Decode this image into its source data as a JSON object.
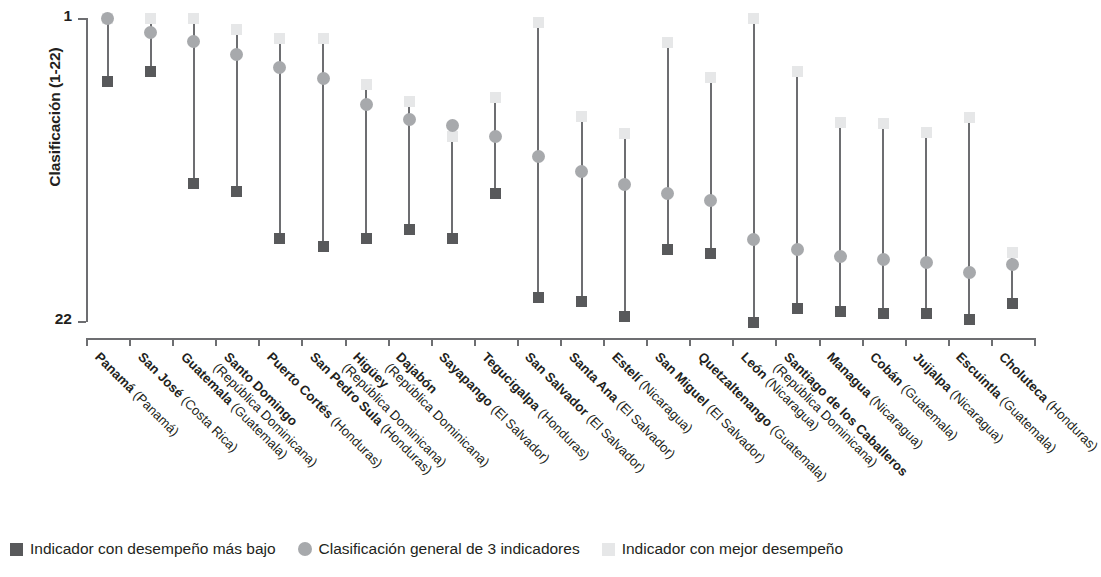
{
  "chart_data": {
    "type": "scatter",
    "title": "",
    "subtitle": "",
    "xlabel": "",
    "ylabel": "Clasificación (1-22)",
    "ylim": [
      1,
      22
    ],
    "y_ticks": [
      "1",
      "22"
    ],
    "y_axis_inverted": true,
    "grid": false,
    "legend_position": "bottom",
    "colors": {
      "lowest": "#58595b",
      "overall": "#a7a9ac",
      "best": "#e6e7e8",
      "axis": "#6d6e71",
      "text": "#231f20"
    },
    "legend": [
      {
        "marker": "square",
        "color": "#58595b",
        "label": "Indicador con desempeño más bajo"
      },
      {
        "marker": "circle",
        "color": "#a7a9ac",
        "label": "Clasificación general de 3 indicadores"
      },
      {
        "marker": "square",
        "color": "#e6e7e8",
        "label": "Indicador con mejor desempeño"
      }
    ],
    "series": [
      {
        "name": "Indicador con desempeño más bajo",
        "marker": "square",
        "color": "#58595b",
        "values": [
          5.4,
          4.7,
          12.4,
          13.0,
          16.2,
          16.8,
          16.2,
          15.6,
          16.2,
          13.1,
          20.3,
          20.6,
          21.6,
          17.0,
          17.3,
          22.0,
          21.1,
          21.3,
          21.4,
          21.4,
          21.8,
          20.7
        ]
      },
      {
        "name": "Clasificación general de 3 indicadores",
        "marker": "circle",
        "color": "#a7a9ac",
        "values": [
          1.0,
          2.0,
          2.6,
          3.5,
          4.4,
          5.2,
          7.0,
          8.0,
          8.4,
          9.2,
          10.6,
          11.6,
          12.5,
          13.1,
          13.6,
          16.3,
          17.0,
          17.5,
          17.7,
          17.9,
          18.6,
          18.0
        ]
      },
      {
        "name": "Indicador con mejor desempeño",
        "marker": "square",
        "color": "#e6e7e8",
        "values": [
          1.0,
          1.0,
          1.0,
          1.8,
          2.4,
          2.4,
          5.6,
          6.8,
          9.2,
          6.5,
          1.3,
          7.8,
          9.0,
          2.7,
          5.1,
          1.0,
          4.7,
          8.2,
          8.3,
          8.9,
          7.9,
          17.2
        ]
      }
    ],
    "categories": [
      {
        "city": "Panamá",
        "country": "(Panamá)"
      },
      {
        "city": "San José",
        "country": "(Costa Rica)"
      },
      {
        "city": "Guatemala",
        "country": "(Guatemala)"
      },
      {
        "city": "Santo Domingo",
        "country": "(República Dominicana)"
      },
      {
        "city": "Puerto Cortés",
        "country": "(Honduras)"
      },
      {
        "city": "San Pedro Sula",
        "country": "(Honduras)"
      },
      {
        "city": "Higüey",
        "country": "(República Dominicana)"
      },
      {
        "city": "Dajabón",
        "country": "(República Dominicana)"
      },
      {
        "city": "Sayapango",
        "country": "(El Salvador)"
      },
      {
        "city": "Tegucigalpa",
        "country": "(Honduras)"
      },
      {
        "city": "San Salvador",
        "country": "(El Salvador)"
      },
      {
        "city": "Santa Ana",
        "country": "(El Salvador)"
      },
      {
        "city": "Estelí",
        "country": "(Nicaragua)"
      },
      {
        "city": "San Miguel",
        "country": "(El Salvador)"
      },
      {
        "city": "Quetzaltenango",
        "country": "(Guatemala)"
      },
      {
        "city": "León",
        "country": "(Nicaragua)"
      },
      {
        "city": "Santiago de los Caballeros",
        "country": "(República Dominicana)"
      },
      {
        "city": "Managua",
        "country": "(Nicaragua)"
      },
      {
        "city": "Cobán",
        "country": "(Guatemala)"
      },
      {
        "city": "Juijalpa",
        "country": "(Nicaragua)"
      },
      {
        "city": "Escuintla",
        "country": "(Guatemala)"
      },
      {
        "city": "Choluteca",
        "country": "(Honduras)"
      }
    ]
  }
}
